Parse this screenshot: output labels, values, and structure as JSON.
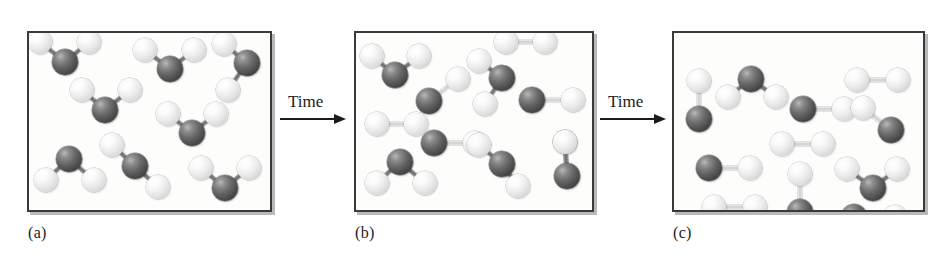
{
  "figure": {
    "colors": {
      "atom_dark": "#4a4a4a",
      "atom_light": "#ededed",
      "frame": "#3a3a3a",
      "background": "#fdfdfc",
      "text": "#1b1b1b"
    },
    "geometry": {
      "atom_radius_dark": 13,
      "atom_radius_light": 12,
      "panel_y": 31,
      "panel_height": 181
    }
  },
  "arrows": [
    {
      "name": "arrow-1",
      "label": "Time",
      "x": 280,
      "y": 92,
      "length": 66,
      "label_offset_x": 8
    },
    {
      "name": "arrow-2",
      "label": "Time",
      "x": 600,
      "y": 92,
      "length": 66,
      "label_offset_x": 8
    }
  ],
  "panels": [
    {
      "id": "a",
      "label": "(a)",
      "label_x": 28,
      "label_y": 224,
      "x": 27,
      "y": 31,
      "width": 245,
      "height": 181,
      "counts": {
        "triatomic": 8,
        "diatomic_dark_light": 0,
        "diatomic_light_light": 0
      },
      "molecules": [
        {
          "type": "triatomic",
          "center": [
            63,
            60
          ],
          "ligands": [
            [
              38,
              40
            ],
            [
              87,
              40
            ]
          ]
        },
        {
          "type": "triatomic",
          "center": [
            168,
            67
          ],
          "ligands": [
            [
              143,
              48
            ],
            [
              192,
              48
            ]
          ]
        },
        {
          "type": "triatomic",
          "center": [
            245,
            61
          ],
          "ligands": [
            [
              222,
              42
            ],
            [
              226,
              88
            ]
          ]
        },
        {
          "type": "triatomic",
          "center": [
            103,
            108
          ],
          "ligands": [
            [
              80,
              88
            ],
            [
              128,
              88
            ]
          ]
        },
        {
          "type": "triatomic",
          "center": [
            190,
            131
          ],
          "ligands": [
            [
              166,
              112
            ],
            [
              214,
              112
            ]
          ]
        },
        {
          "type": "triatomic",
          "center": [
            67,
            157
          ],
          "ligands": [
            [
              44,
              178
            ],
            [
              92,
              178
            ]
          ]
        },
        {
          "type": "triatomic",
          "center": [
            133,
            164
          ],
          "ligands": [
            [
              156,
              185
            ],
            [
              110,
              143
            ]
          ]
        },
        {
          "type": "triatomic",
          "center": [
            223,
            186
          ],
          "ligands": [
            [
              199,
              166
            ],
            [
              247,
              166
            ]
          ]
        }
      ]
    },
    {
      "id": "b",
      "label": "(b)",
      "label_x": 355,
      "label_y": 224,
      "x": 354,
      "y": 31,
      "width": 240,
      "height": 181,
      "counts": {
        "triatomic": 5,
        "diatomic_dark_light": 3,
        "diatomic_light_light": 2
      },
      "molecules": [
        {
          "type": "triatomic",
          "center": [
            393,
            73
          ],
          "ligands": [
            [
              370,
              54
            ],
            [
              417,
              54
            ]
          ]
        },
        {
          "type": "triatomic",
          "center": [
            500,
            76
          ],
          "ligands": [
            [
              477,
              59
            ],
            [
              483,
              102
            ]
          ]
        },
        {
          "type": "diatomic-light",
          "a": [
            504,
            40
          ],
          "b": [
            543,
            40
          ]
        },
        {
          "type": "diatomic-dark",
          "a": [
            530,
            98
          ],
          "b": [
            571,
            98
          ]
        },
        {
          "type": "diatomic-dark",
          "a": [
            427,
            99
          ],
          "b": [
            456,
            77
          ]
        },
        {
          "type": "diatomic-light",
          "a": [
            375,
            122
          ],
          "b": [
            414,
            122
          ]
        },
        {
          "type": "diatomic-dark",
          "a": [
            432,
            141
          ],
          "b": [
            473,
            141
          ]
        },
        {
          "type": "triatomic",
          "center": [
            398,
            160
          ],
          "ligands": [
            [
              375,
              181
            ],
            [
              423,
              181
            ]
          ]
        },
        {
          "type": "triatomic",
          "center": [
            500,
            162
          ],
          "ligands": [
            [
              477,
              143
            ],
            [
              516,
              184
            ]
          ]
        },
        {
          "type": "triatomic",
          "center": [
            565,
            174
          ],
          "ligands": [
            [
              563,
              140
            ],
            [
              563,
              140
            ]
          ]
        }
      ]
    },
    {
      "id": "c",
      "label": "(c)",
      "label_x": 673,
      "label_y": 224,
      "x": 672,
      "y": 31,
      "width": 253,
      "height": 181,
      "counts": {
        "triatomic": 2,
        "diatomic_dark_light": 5,
        "diatomic_light_light": 3
      },
      "molecules": [
        {
          "type": "diatomic-dark",
          "a": [
            697,
            117
          ],
          "b": [
            697,
            79
          ]
        },
        {
          "type": "triatomic",
          "center": [
            749,
            77
          ],
          "ligands": [
            [
              726,
              95
            ],
            [
              774,
              95
            ]
          ]
        },
        {
          "type": "diatomic-dark",
          "a": [
            801,
            107
          ],
          "b": [
            842,
            107
          ]
        },
        {
          "type": "diatomic-light",
          "a": [
            855,
            78
          ],
          "b": [
            896,
            78
          ]
        },
        {
          "type": "diatomic-dark",
          "a": [
            889,
            128
          ],
          "b": [
            861,
            106
          ]
        },
        {
          "type": "diatomic-light",
          "a": [
            780,
            142
          ],
          "b": [
            821,
            142
          ]
        },
        {
          "type": "diatomic-dark",
          "a": [
            707,
            166
          ],
          "b": [
            748,
            166
          ]
        },
        {
          "type": "triatomic",
          "center": [
            871,
            186
          ],
          "ligands": [
            [
              845,
              167
            ],
            [
              895,
              167
            ]
          ]
        },
        {
          "type": "diatomic-light",
          "a": [
            712,
            205
          ],
          "b": [
            753,
            205
          ]
        },
        {
          "type": "diatomic-dark",
          "a": [
            798,
            210
          ],
          "b": [
            798,
            172
          ]
        },
        {
          "type": "diatomic-dark",
          "a": [
            852,
            215
          ],
          "b": [
            893,
            215
          ]
        }
      ]
    }
  ]
}
